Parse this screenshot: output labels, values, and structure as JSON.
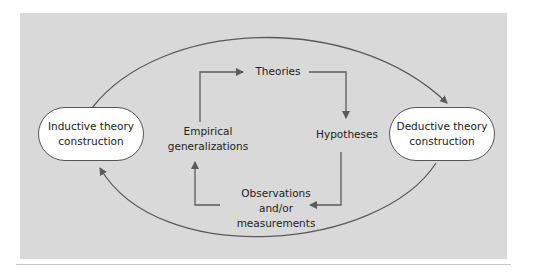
{
  "diagram": {
    "nodes": {
      "inductive": {
        "line1": "Inductive theory",
        "line2": "construction"
      },
      "deductive": {
        "line1": "Deductive theory",
        "line2": "construction"
      },
      "theories": "Theories",
      "hypotheses": "Hypotheses",
      "observations": {
        "line1": "Observations",
        "line2": "and/or",
        "line3": "measurements"
      },
      "empirical": {
        "line1": "Empirical",
        "line2": "generalizations"
      }
    },
    "edges": [
      {
        "from": "Inductive theory construction",
        "to": "Deductive theory construction",
        "shape": "top-arc"
      },
      {
        "from": "Deductive theory construction",
        "to": "Inductive theory construction",
        "shape": "bottom-arc"
      },
      {
        "from": "Empirical generalizations",
        "to": "Theories"
      },
      {
        "from": "Theories",
        "to": "Hypotheses"
      },
      {
        "from": "Hypotheses",
        "to": "Observations and/or measurements"
      },
      {
        "from": "Observations and/or measurements",
        "to": "Empirical generalizations"
      }
    ],
    "colors": {
      "panel": "#d9d9d9",
      "line": "#5a5a5a",
      "node_fill": "#ffffff",
      "text": "#222222"
    }
  }
}
